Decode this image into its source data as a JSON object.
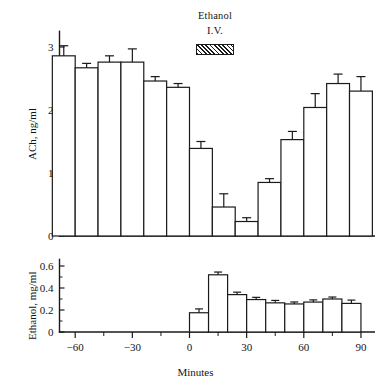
{
  "figure": {
    "background": "#ffffff",
    "ink_color": "#1a1a1a"
  },
  "annotation": {
    "line1": "Ethanol",
    "line2": "I.V.",
    "swatch_name": "hatched-bar",
    "swatch_start_min": 0,
    "swatch_end_min": 15
  },
  "axes": {
    "x_label": "Minutes",
    "top_y_label": "ACh, ng/ml",
    "bottom_y_label": "Ethanol, mg/ml"
  },
  "chart_data": [
    {
      "type": "bar",
      "panel": "top",
      "title": "",
      "xlabel": "Minutes",
      "ylabel": "ACh, ng/ml",
      "xlim": [
        -75,
        97
      ],
      "ylim": [
        0,
        3.25
      ],
      "xticks": [
        -60,
        -30,
        0,
        30,
        60,
        90
      ],
      "yticks": [
        0,
        1,
        2,
        3
      ],
      "ytick_labels": [
        "0",
        "1",
        "2",
        "3"
      ],
      "grid": false,
      "legend": "none",
      "bar_width_min": 12,
      "x": [
        -66,
        -54,
        -42,
        -30,
        -18,
        -6,
        6,
        18,
        30,
        42,
        54,
        66,
        78,
        90
      ],
      "values": [
        2.86,
        2.67,
        2.76,
        2.76,
        2.46,
        2.36,
        1.39,
        0.46,
        0.23,
        0.85,
        1.53,
        2.04,
        2.42,
        2.3
      ],
      "errors": [
        0.16,
        0.07,
        0.1,
        0.21,
        0.07,
        0.06,
        0.11,
        0.21,
        0.06,
        0.06,
        0.13,
        0.22,
        0.15,
        0.23
      ]
    },
    {
      "type": "bar",
      "panel": "bottom",
      "title": "",
      "xlabel": "Minutes",
      "ylabel": "Ethanol, mg/ml",
      "xlim": [
        -75,
        97
      ],
      "ylim": [
        0,
        0.66
      ],
      "xticks": [
        -60,
        -30,
        0,
        30,
        60,
        90
      ],
      "yticks": [
        0,
        0.2,
        0.4,
        0.6
      ],
      "ytick_labels": [
        "0",
        "0.2",
        "0.4",
        "0.6"
      ],
      "grid": false,
      "legend": "none",
      "bar_width_min": 10,
      "x": [
        5,
        15,
        25,
        35,
        45,
        55,
        65,
        75,
        85
      ],
      "values": [
        0.175,
        0.52,
        0.34,
        0.295,
        0.265,
        0.255,
        0.272,
        0.3,
        0.26
      ],
      "errors": [
        0.035,
        0.025,
        0.022,
        0.02,
        0.022,
        0.018,
        0.02,
        0.018,
        0.03
      ]
    }
  ]
}
